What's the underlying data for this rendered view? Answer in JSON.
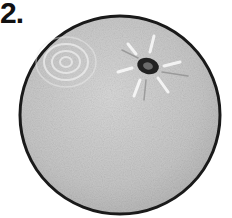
{
  "item": {
    "number_label": "2.",
    "subject": "orange",
    "description": "greyscale drawing of a round citrus fruit viewed from the top with a stem scar",
    "colors": {
      "outline": "#1a1a1a",
      "fill": "#c8c8c8",
      "highlight": "#e6e6e6",
      "stem": "#222222"
    }
  }
}
